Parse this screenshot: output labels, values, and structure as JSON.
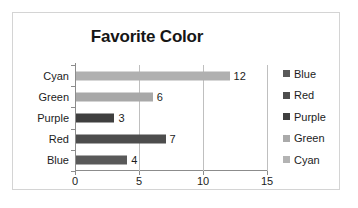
{
  "chart_data": {
    "type": "bar",
    "orientation": "horizontal",
    "title": "Favorite Color",
    "xlabel": "",
    "ylabel": "",
    "categories": [
      "Blue",
      "Red",
      "Purple",
      "Green",
      "Cyan"
    ],
    "values": [
      4,
      7,
      3,
      6,
      12
    ],
    "data_labels": [
      "4",
      "7",
      "3",
      "6",
      "12"
    ],
    "category_order_top_to_bottom": [
      "Cyan",
      "Green",
      "Purple",
      "Red",
      "Blue"
    ],
    "xlim": [
      0,
      15
    ],
    "xticks": [
      0,
      5,
      10,
      15
    ],
    "xtick_labels": [
      "0",
      "5",
      "10",
      "15"
    ],
    "grid": "vertical",
    "legend_position": "right",
    "legend": [
      {
        "label": "Blue",
        "color": "#595959"
      },
      {
        "label": "Red",
        "color": "#4d4d4d"
      },
      {
        "label": "Purple",
        "color": "#3f3f3f"
      },
      {
        "label": "Green",
        "color": "#aaaaaa"
      },
      {
        "label": "Cyan",
        "color": "#b3b3b3"
      }
    ],
    "series_colors": {
      "Blue": "#595959",
      "Red": "#4d4d4d",
      "Purple": "#3f3f3f",
      "Green": "#a8a8a8",
      "Cyan": "#b0b0b0"
    },
    "axis_color": "#8c8c8c",
    "gridline_color": "#bfbfbf",
    "border_color": "#d4d4d4",
    "background": "#ffffff"
  }
}
